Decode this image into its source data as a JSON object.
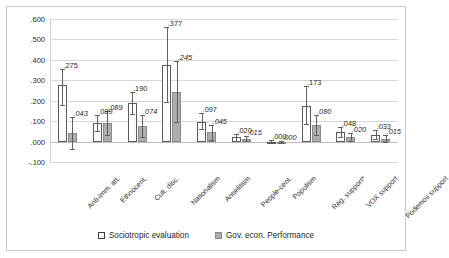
{
  "chart_data": {
    "type": "bar",
    "title": "",
    "subtitle": "",
    "xlabel": "",
    "ylabel": "",
    "ylim": [
      -0.1,
      0.6
    ],
    "yticks": [
      ".600",
      ".500",
      ".400",
      ".300",
      ".200",
      ".100",
      ".000",
      "-.100"
    ],
    "ytick_values": [
      0.6,
      0.5,
      0.4,
      0.3,
      0.2,
      0.1,
      0.0,
      -0.1
    ],
    "grid": true,
    "legend_position": "bottom",
    "categories": [
      "Anti-imm. att.",
      "Ethnocent.",
      "Cult. disc.",
      "Nationalism",
      "Antielitism",
      "People-cent.",
      "Populism",
      "Reg. support*",
      "VOX support",
      "Podemos support"
    ],
    "series": [
      {
        "name": "Sociotropic evaluation",
        "color": "#ffffff",
        "values": [
          0.275,
          0.089,
          0.19,
          0.377,
          0.097,
          0.02,
          0.0,
          0.173,
          0.048,
          0.033
        ],
        "labels": [
          ".275",
          ".089",
          ".190",
          ".377",
          ".097",
          ".020",
          ".000",
          ".173",
          ".048",
          ".033"
        ],
        "err_low": [
          0.18,
          0.052,
          0.135,
          0.192,
          0.06,
          0.004,
          -0.006,
          0.085,
          0.022,
          0.012
        ],
        "err_high": [
          0.355,
          0.128,
          0.245,
          0.563,
          0.14,
          0.036,
          0.006,
          0.272,
          0.073,
          0.055
        ]
      },
      {
        "name": "Gov. econ. Performance",
        "color": "#adadad",
        "values": [
          0.043,
          0.089,
          0.074,
          0.245,
          0.045,
          0.015,
          0.0,
          0.08,
          0.02,
          0.015
        ],
        "labels": [
          ".043",
          ".089",
          ".074",
          ".245",
          ".045",
          ".015",
          ".000",
          ".080",
          ".020",
          ".015"
        ],
        "err_low": [
          -0.035,
          0.032,
          0.022,
          0.095,
          0.008,
          0.003,
          -0.005,
          0.03,
          0.002,
          -0.002
        ],
        "err_high": [
          0.118,
          0.148,
          0.128,
          0.395,
          0.083,
          0.028,
          0.005,
          0.132,
          0.04,
          0.034
        ]
      }
    ]
  },
  "legend": {
    "items": [
      {
        "label": "Sociotropic evaluation",
        "swatch": "white-square-icon"
      },
      {
        "label": "Gov. econ. Performance",
        "swatch": "gray-square-icon"
      }
    ]
  }
}
